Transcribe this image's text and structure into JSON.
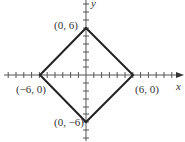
{
  "diagram": {
    "type": "coordinate-plane-square",
    "axes": {
      "x_label": "x",
      "y_label": "y"
    },
    "vertices": [
      {
        "name": "top",
        "label": "(0, 6)",
        "x": 0,
        "y": 6
      },
      {
        "name": "right",
        "label": "(6, 0)",
        "x": 6,
        "y": 0
      },
      {
        "name": "bottom",
        "label": "(0, −6)",
        "x": 0,
        "y": -6
      },
      {
        "name": "left",
        "label": "(−6, 0)",
        "x": -6,
        "y": 0
      }
    ]
  }
}
